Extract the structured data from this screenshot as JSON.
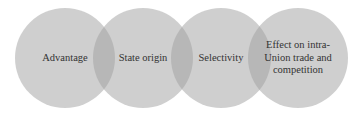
{
  "diagram": {
    "type": "overlapping-circles",
    "colors": {
      "circle_fill": "#cfcfcf",
      "overlap_fill": "#b0b0b0",
      "text": "#333333"
    },
    "circles": [
      {
        "label": "Advantage"
      },
      {
        "label": "State origin"
      },
      {
        "label": "Selectivity"
      },
      {
        "label": "Effect on intra-Union trade and competition"
      }
    ]
  }
}
